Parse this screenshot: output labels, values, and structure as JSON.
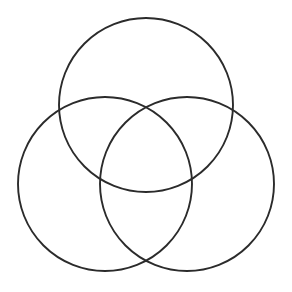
{
  "figure": {
    "type": "venn-diagram",
    "shape_count": 3,
    "background_color": "#ffffff",
    "canvas": {
      "width": 292,
      "height": 292
    },
    "stroke": {
      "color": "#2b2b2b",
      "width": 1.9,
      "style": "solid"
    },
    "fill": "none",
    "labels_present": false,
    "text_present": false,
    "circles": [
      {
        "id": "top-circle",
        "name": "top-circle",
        "cx": 146,
        "cy": 105,
        "r": 87,
        "bounds": {
          "left": 59,
          "top": 18,
          "right": 233,
          "bottom": 192
        }
      },
      {
        "id": "left-circle",
        "name": "left-circle",
        "cx": 105,
        "cy": 184,
        "r": 87,
        "bounds": {
          "left": 18,
          "top": 97,
          "right": 192,
          "bottom": 271
        }
      },
      {
        "id": "right-circle",
        "name": "right-circle",
        "cx": 187,
        "cy": 184,
        "r": 87,
        "bounds": {
          "left": 100,
          "top": 97,
          "right": 274,
          "bottom": 271
        }
      }
    ],
    "intersection_points": [
      {
        "name": "top-center-crossing",
        "x": 146,
        "y": 102
      },
      {
        "name": "bottom-center-crossing",
        "x": 146,
        "y": 258
      },
      {
        "name": "left-upper-crossing",
        "x": 68,
        "y": 145
      },
      {
        "name": "right-upper-crossing",
        "x": 224,
        "y": 145
      },
      {
        "name": "left-lower-crossing",
        "x": 108,
        "y": 186
      },
      {
        "name": "right-lower-crossing",
        "x": 184,
        "y": 186
      }
    ]
  }
}
